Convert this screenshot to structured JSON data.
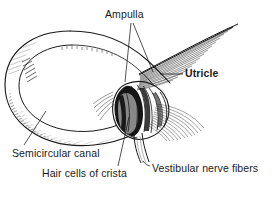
{
  "figure": {
    "kind": "anatomical-line-drawing",
    "background_color": "#ffffff",
    "ink_color": "#1a1a1a",
    "width": 272,
    "height": 199,
    "labels": {
      "ampulla": "Ampulla",
      "utricle": "Utricle",
      "semicircular_canal": "Semicircular canal",
      "hair_cells_of_crista": "Hair cells of crista",
      "vestibular_nerve_fibers": "Vestibular nerve fibers"
    },
    "label_styles": {
      "ampulla": "regular",
      "utricle": "bold",
      "semicircular_canal": "regular",
      "hair_cells_of_crista": "regular",
      "vestibular_nerve_fibers": "regular"
    }
  }
}
